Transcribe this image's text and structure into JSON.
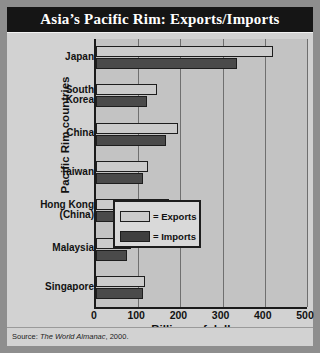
{
  "title": "Asia’s Pacific Rim: Exports/Imports",
  "source": {
    "prefix": "Source:",
    "italic": "The World Almanac",
    "suffix": ", 2000."
  },
  "axes": {
    "ylabel": "Pacific Rim countries",
    "xlabel": "Billions of dollars"
  },
  "legend": {
    "exports": "= Exports",
    "imports": "= Imports"
  },
  "chart_data": {
    "type": "bar",
    "orientation": "horizontal",
    "title": "Asia’s Pacific Rim: Exports/Imports",
    "xlabel": "Billions of dollars",
    "ylabel": "Pacific Rim countries",
    "xlim": [
      0,
      500
    ],
    "xticks": [
      0,
      100,
      200,
      300,
      400,
      500
    ],
    "grid": true,
    "legend_position": "inside-lower-right",
    "categories": [
      "Japan",
      "South Korea",
      "China",
      "Taiwan",
      "Hong Kong (China)",
      "Malaysia",
      "Singapore"
    ],
    "category_lines": [
      [
        "Japan"
      ],
      [
        "South",
        "Korea"
      ],
      [
        "China"
      ],
      [
        "Taiwan"
      ],
      [
        "Hong Kong",
        "(China)"
      ],
      [
        "Malaysia"
      ],
      [
        "Singapore"
      ]
    ],
    "series": [
      {
        "name": "Exports",
        "color": "#cbcbcb",
        "values": [
          420,
          144,
          195,
          123,
          174,
          84,
          115
        ]
      },
      {
        "name": "Imports",
        "color": "#4a4a4a",
        "values": [
          333,
          120,
          166,
          111,
          186,
          74,
          112
        ]
      }
    ]
  }
}
